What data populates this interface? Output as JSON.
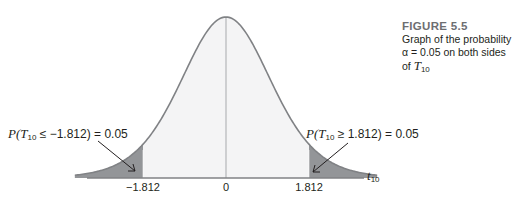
{
  "caption": {
    "figure_label": "FIGURE 5.5",
    "line1": "Graph of the probability",
    "line2_prefix": "α = 0.05 on both sides of ",
    "line2_var": "T",
    "line2_sub": "10"
  },
  "annotations": {
    "left": {
      "prefix": "P(",
      "var": "T",
      "sub": "10",
      "rel": " ≤ −1.812) = 0.05"
    },
    "right": {
      "prefix": "P(",
      "var": "T",
      "sub": "10",
      "rel": " ≥ 1.812) = 0.05"
    }
  },
  "axis": {
    "label_var": "t",
    "label_sub": "10",
    "ticks": [
      "−1.812",
      "0",
      "1.812"
    ]
  },
  "colors": {
    "curve": "#808285",
    "body_fill": "#f4f4f5",
    "tail_fill": "#939598",
    "axis": "#808285"
  },
  "chart_data": {
    "type": "area",
    "title": "FIGURE 5.5 Graph of the probability α = 0.05 on both sides of T10",
    "distribution": "Student t, df = 10",
    "xlabel": "t10",
    "ylabel": "",
    "x_ticks": [
      -1.812,
      0,
      1.812
    ],
    "x_tick_labels": [
      "−1.812",
      "0",
      "1.812"
    ],
    "critical_values": [
      -1.812,
      1.812
    ],
    "alpha": 0.05,
    "shaded_regions": [
      {
        "range": [
          -3.5,
          -1.812
        ],
        "probability": 0.05,
        "label": "P(T10 ≤ −1.812) = 0.05"
      },
      {
        "range": [
          1.812,
          3.5
        ],
        "probability": 0.05,
        "label": "P(T10 ≥ 1.812) = 0.05"
      }
    ],
    "grid": false,
    "legend": "none"
  }
}
